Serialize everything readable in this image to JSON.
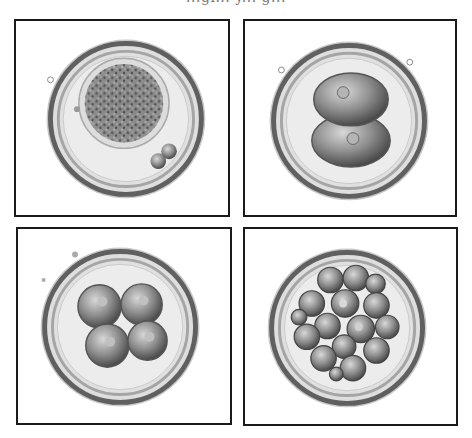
{
  "figure": {
    "caption_partial": "...gi... y... g...",
    "panels": [
      {
        "id": "zygote",
        "stage": "1-cell zygote",
        "cells": 1,
        "polar_bodies": 2
      },
      {
        "id": "two-cell",
        "stage": "2-cell embryo",
        "cells": 2
      },
      {
        "id": "four-cell",
        "stage": "4-cell embryo",
        "cells": 4
      },
      {
        "id": "morula",
        "stage": "morula",
        "cells": 16
      }
    ],
    "colors": {
      "border": "#1a1a1a",
      "zona_dark": "#4a4a4a",
      "zona_light": "#bdbdbd",
      "cytoplasm": "#e6e6e6",
      "cell_fill": "#9a9a9a",
      "background": "#ffffff"
    }
  }
}
